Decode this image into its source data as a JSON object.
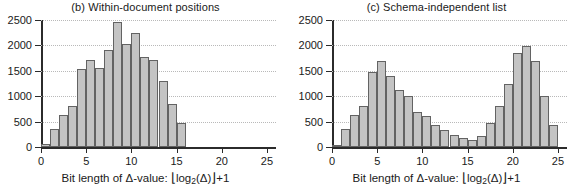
{
  "figure": {
    "axis_color": "#2b2b2b",
    "bar_fill": "#c4c4c4",
    "bar_edge": "#636363",
    "grid_color": "#b9b9b9",
    "background": "#ffffff"
  },
  "xaxis_title": {
    "prefix": "Bit length of ",
    "delta_value": "Δ-value:",
    "floor_open": "⌊",
    "log": "log",
    "log_sub": "2",
    "log_arg": "(Δ)",
    "floor_close": "⌋",
    "plus_one": "+1",
    "full": "Bit length of Δ-value: ⌊log2(Δ)⌋ +1"
  },
  "yticks": [
    {
      "label": "0",
      "value": 0
    },
    {
      "label": "500",
      "value": 500
    },
    {
      "label": "1000",
      "value": 1000
    },
    {
      "label": "1500",
      "value": 1500
    },
    {
      "label": "2000",
      "value": 2000
    },
    {
      "label": "2500",
      "value": 2500
    }
  ],
  "xticks": [
    {
      "label": "0",
      "value": 0
    },
    {
      "label": "5",
      "value": 5
    },
    {
      "label": "10",
      "value": 10
    },
    {
      "label": "15",
      "value": 15
    },
    {
      "label": "20",
      "value": 20
    },
    {
      "label": "25",
      "value": 25
    }
  ],
  "chart_data": [
    {
      "type": "bar",
      "panel": "b",
      "title": "(b) Within-document positions",
      "xlabel": "Bit length of Δ-value: ⌊log2(Δ)⌋ +1",
      "ylabel": "",
      "xlim": [
        0,
        26
      ],
      "ylim": [
        0,
        2500
      ],
      "grid": true,
      "legend": "none",
      "bin_width": 1,
      "categories": [
        1,
        2,
        3,
        4,
        5,
        6,
        7,
        8,
        9,
        10,
        11,
        12,
        13,
        14,
        15,
        16
      ],
      "values": [
        50,
        360,
        640,
        810,
        1540,
        1710,
        1560,
        1910,
        2460,
        2020,
        2240,
        1780,
        1720,
        1290,
        840,
        470
      ]
    },
    {
      "type": "bar",
      "panel": "c",
      "title": "(c) Schema-independent list",
      "xlabel": "Bit length of Δ-value: ⌊log2(Δ)⌋ +1",
      "ylabel": "",
      "xlim": [
        0,
        26
      ],
      "ylim": [
        0,
        2500
      ],
      "grid": true,
      "legend": "none",
      "bin_width": 1,
      "categories": [
        1,
        2,
        3,
        4,
        5,
        6,
        7,
        8,
        9,
        10,
        11,
        12,
        13,
        14,
        15,
        16,
        17,
        18,
        19,
        20,
        21,
        22,
        23,
        24,
        25
      ],
      "values": [
        40,
        350,
        630,
        800,
        1480,
        1700,
        1390,
        1130,
        1010,
        690,
        620,
        440,
        330,
        230,
        170,
        145,
        220,
        480,
        810,
        1240,
        1860,
        1980,
        1700,
        1000,
        430
      ]
    }
  ]
}
